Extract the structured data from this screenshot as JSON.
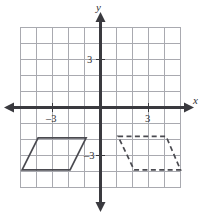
{
  "figure": {
    "x_axis_label": "x",
    "y_axis_label": "y"
  },
  "chart_data": {
    "type": "scatter",
    "title": "",
    "xlabel": "x",
    "ylabel": "y",
    "grid": true,
    "legend": null,
    "xlim": [
      -5.6,
      5.3
    ],
    "ylim": [
      -6.8,
      6.4
    ],
    "xticks": [
      -3,
      3
    ],
    "yticks": [
      -3,
      3
    ],
    "xtick_labels": [
      "–3",
      "3"
    ],
    "ytick_labels": [
      "–3",
      "3"
    ],
    "grid_spacing_units": 1,
    "origin": [
      0,
      0
    ],
    "series": [
      {
        "name": "pre-image parallelogram",
        "style": "solid",
        "closed": true,
        "points": [
          [
            -3.9,
            -1.9
          ],
          [
            -0.9,
            -1.9
          ],
          [
            -1.9,
            -3.9
          ],
          [
            -4.9,
            -3.9
          ]
        ]
      },
      {
        "name": "image parallelogram",
        "style": "dashed",
        "closed": true,
        "points": [
          [
            1.1,
            -1.8
          ],
          [
            4.1,
            -1.8
          ],
          [
            5.0,
            -3.9
          ],
          [
            2.1,
            -3.9
          ]
        ]
      }
    ],
    "annotations": []
  },
  "colors": {
    "grid": "#a9aab0",
    "axis": "#3a3a3f",
    "shape_stroke": "#4a4a50",
    "background": "#ffffff",
    "text": "#2f2f33"
  }
}
